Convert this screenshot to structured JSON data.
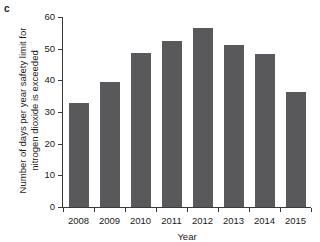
{
  "panel": {
    "label": "c"
  },
  "chart_data": {
    "type": "bar",
    "title": "",
    "xlabel": "Year",
    "ylabel": "Number of days per year safety limit for nitrogen dioxide is exceeded",
    "ylabel_lines": [
      "Number of days per year safety limit for",
      "nitrogen dioxide is exceeded"
    ],
    "categories": [
      "2008",
      "2009",
      "2010",
      "2011",
      "2012",
      "2013",
      "2014",
      "2015"
    ],
    "values": [
      32.7,
      39.5,
      48.5,
      52.3,
      56.5,
      51.2,
      48.2,
      36.4
    ],
    "series": [
      {
        "name": "Days exceeding NO2 safety limit",
        "values": [
          32.7,
          39.5,
          48.5,
          52.3,
          56.5,
          51.2,
          48.2,
          36.4
        ]
      }
    ],
    "ylim": [
      0,
      60
    ],
    "yticks": [
      0,
      10,
      20,
      30,
      40,
      50,
      60
    ],
    "ytick_labels": [
      "0",
      "10",
      "20",
      "30",
      "40",
      "50",
      "60"
    ],
    "grid": false,
    "legend": "none",
    "bar_color": "#59595b",
    "axis_color": "#3a3a3a",
    "background": "#ffffff"
  }
}
